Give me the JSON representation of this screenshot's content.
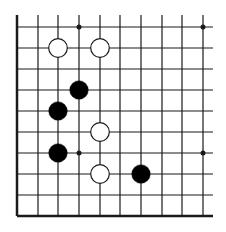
{
  "board": {
    "description": "Go board fragment (lower-left corner region)",
    "grid": {
      "x": [
        17,
        38,
        58,
        79,
        100,
        120,
        141,
        162,
        182,
        203
      ],
      "y": [
        27,
        48,
        69,
        90,
        111,
        132,
        153,
        174,
        195,
        216
      ],
      "extend_top": 15,
      "extend_right": 213,
      "edges": [
        "left",
        "bottom"
      ]
    },
    "colors": {
      "line": "#1a1a1a",
      "black_stone": "#000000",
      "white_stone": "#ffffff",
      "stone_outline": "#1a1a1a"
    },
    "star_points": [
      {
        "col": 3,
        "row": 0
      },
      {
        "col": 9,
        "row": 0
      },
      {
        "col": 3,
        "row": 6
      },
      {
        "col": 9,
        "row": 6
      }
    ],
    "stones": [
      {
        "color": "white",
        "col": 2,
        "row": 1
      },
      {
        "color": "white",
        "col": 4,
        "row": 1
      },
      {
        "color": "black",
        "col": 3,
        "row": 3
      },
      {
        "color": "black",
        "col": 2,
        "row": 4
      },
      {
        "color": "white",
        "col": 4,
        "row": 5
      },
      {
        "color": "black",
        "col": 2,
        "row": 6
      },
      {
        "color": "white",
        "col": 4,
        "row": 7
      },
      {
        "color": "black",
        "col": 6,
        "row": 7
      }
    ]
  }
}
